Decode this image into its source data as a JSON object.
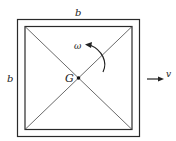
{
  "diagram": {
    "labels": {
      "top_side": "b",
      "left_side": "b",
      "center_point": "G",
      "angular_velocity": "ω",
      "velocity": "v"
    },
    "colors": {
      "stroke": "#2a2a2a",
      "background": "#ffffff"
    }
  }
}
